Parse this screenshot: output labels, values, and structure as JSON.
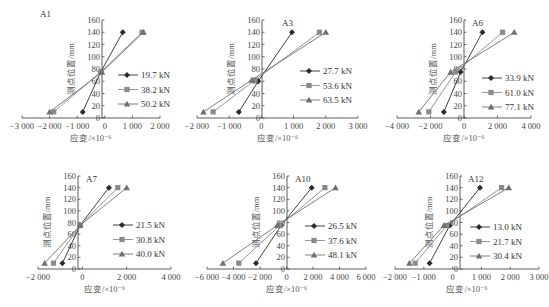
{
  "chart_data": [
    {
      "type": "line",
      "title": "A1",
      "xlabel": "应变/×10⁻⁶",
      "ylabel": "测点位置/mm",
      "xlim": [
        -3000,
        2000
      ],
      "ylim": [
        0,
        160
      ],
      "xticks": [
        -3000,
        -2000,
        -1000,
        0,
        1000,
        2000
      ],
      "xtick_labels": [
        "−3 000",
        "−2 000",
        "−1 000",
        "0",
        "1 000",
        "2 000"
      ],
      "yticks": [
        0,
        20,
        40,
        60,
        80,
        100,
        120,
        140,
        160
      ],
      "legend_position": "right-center",
      "grid": false,
      "series": [
        {
          "name": "19.7 kN",
          "marker": "diamond",
          "points": [
            [
              -800,
              10
            ],
            [
              -150,
              75
            ],
            [
              650,
              140
            ]
          ]
        },
        {
          "name": "38.2 kN",
          "marker": "square",
          "points": [
            [
              -1850,
              10
            ],
            [
              -150,
              75
            ],
            [
              1350,
              140
            ]
          ]
        },
        {
          "name": "50.2 kN",
          "marker": "triangle",
          "points": [
            [
              -2000,
              10
            ],
            [
              -100,
              75
            ],
            [
              1400,
              140
            ]
          ]
        }
      ],
      "frame": {
        "ox": 102,
        "oy": 118,
        "x0px": 22,
        "x1px": 160,
        "ytop": 20,
        "legx": 118,
        "legy": 75
      }
    },
    {
      "type": "line",
      "title": "A3",
      "xlabel": "应变/×10⁻⁶",
      "ylabel": "测点位置/mm",
      "xlim": [
        -2000,
        3000
      ],
      "ylim": [
        0,
        160
      ],
      "xticks": [
        -2000,
        -1000,
        0,
        1000,
        2000,
        3000
      ],
      "xtick_labels": [
        "−2 000",
        "−1 000",
        "0",
        "1 000",
        "2 000",
        "3 000"
      ],
      "yticks": [
        0,
        20,
        40,
        60,
        80,
        100,
        120,
        140,
        160
      ],
      "legend_position": "right-center",
      "grid": false,
      "series": [
        {
          "name": "27.7 kN",
          "marker": "diamond",
          "points": [
            [
              -700,
              10
            ],
            [
              -100,
              60
            ],
            [
              950,
              140
            ]
          ]
        },
        {
          "name": "53.6 kN",
          "marker": "square",
          "points": [
            [
              -1500,
              10
            ],
            [
              -200,
              62
            ],
            [
              1800,
              140
            ]
          ]
        },
        {
          "name": "63.5 kN",
          "marker": "triangle",
          "points": [
            [
              -1800,
              10
            ],
            [
              -300,
              62
            ],
            [
              2000,
              140
            ]
          ]
        }
      ],
      "frame": {
        "ox": 262,
        "oy": 118,
        "x0px": 197,
        "x1px": 358,
        "ytop": 20,
        "legx": 300,
        "legy": 71
      }
    },
    {
      "type": "line",
      "title": "A6",
      "xlabel": "应变/×10⁻⁶",
      "ylabel": "测点位置/mm",
      "xlim": [
        -4000,
        4000
      ],
      "ylim": [
        0,
        160
      ],
      "xticks": [
        -4000,
        -2000,
        0,
        2000,
        4000
      ],
      "xtick_labels": [
        "−4 000",
        "−2 000",
        "0",
        "2 000",
        "4 000"
      ],
      "yticks": [
        0,
        20,
        40,
        60,
        80,
        100,
        120,
        140,
        160
      ],
      "legend_position": "right-center",
      "grid": false,
      "series": [
        {
          "name": "33.9 kN",
          "marker": "diamond",
          "points": [
            [
              -1200,
              10
            ],
            [
              -200,
              75
            ],
            [
              1100,
              140
            ]
          ]
        },
        {
          "name": "61.0 kN",
          "marker": "square",
          "points": [
            [
              -2100,
              10
            ],
            [
              -500,
              75
            ],
            [
              2300,
              140
            ]
          ]
        },
        {
          "name": "77.1 kN",
          "marker": "triangle",
          "points": [
            [
              -2700,
              10
            ],
            [
              -800,
              75
            ],
            [
              3000,
              140
            ]
          ]
        }
      ],
      "frame": {
        "ox": 464,
        "oy": 118,
        "x0px": 397,
        "x1px": 531,
        "ytop": 20,
        "legx": 482,
        "legy": 78
      }
    },
    {
      "type": "line",
      "title": "A7",
      "xlabel": "应变/×10⁻⁶",
      "ylabel": "测点位置/mm",
      "xlim": [
        -2000,
        4000
      ],
      "ylim": [
        0,
        160
      ],
      "xticks": [
        -2000,
        0,
        2000,
        4000
      ],
      "xtick_labels": [
        "−2 000",
        "0",
        "2 000",
        "4 000"
      ],
      "yticks": [
        0,
        20,
        40,
        60,
        80,
        100,
        120,
        140,
        160
      ],
      "legend_position": "right-center",
      "grid": false,
      "series": [
        {
          "name": "21.5 kN",
          "marker": "diamond",
          "points": [
            [
              -900,
              10
            ],
            [
              -100,
              75
            ],
            [
              1200,
              140
            ]
          ]
        },
        {
          "name": "30.8 kN",
          "marker": "square",
          "points": [
            [
              -1300,
              10
            ],
            [
              -100,
              75
            ],
            [
              1600,
              140
            ]
          ]
        },
        {
          "name": "40.0 kN",
          "marker": "triangle",
          "points": [
            [
              -1700,
              10
            ],
            [
              -100,
              75
            ],
            [
              2000,
              140
            ]
          ]
        }
      ],
      "frame": {
        "ox": 78,
        "oy": 269,
        "x0px": 38,
        "x1px": 171,
        "ytop": 176,
        "legx": 113,
        "legy": 225
      }
    },
    {
      "type": "line",
      "title": "A10",
      "xlabel": "应变/×10⁻⁶",
      "ylabel": "测点位置/mm",
      "xlim": [
        -6000,
        6000
      ],
      "ylim": [
        0,
        160
      ],
      "xticks": [
        -6000,
        -4000,
        -2000,
        0,
        2000,
        4000,
        6000
      ],
      "xtick_labels": [
        "−6 000",
        "−4 000",
        "−2 000",
        "0",
        "2 000",
        "4 000",
        "6 000"
      ],
      "yticks": [
        0,
        20,
        40,
        60,
        80,
        100,
        120,
        140,
        160
      ],
      "legend_position": "right-center",
      "grid": false,
      "series": [
        {
          "name": "26.5 kN",
          "marker": "diamond",
          "points": [
            [
              -2300,
              10
            ],
            [
              -400,
              75
            ],
            [
              1900,
              140
            ]
          ]
        },
        {
          "name": "37.6 kN",
          "marker": "square",
          "points": [
            [
              -3600,
              10
            ],
            [
              -500,
              75
            ],
            [
              2900,
              140
            ]
          ]
        },
        {
          "name": "48.1 kN",
          "marker": "triangle",
          "points": [
            [
              -4800,
              10
            ],
            [
              -700,
              75
            ],
            [
              3700,
              140
            ]
          ]
        }
      ],
      "frame": {
        "ox": 287,
        "oy": 269,
        "x0px": 207,
        "x1px": 366,
        "ytop": 176,
        "legx": 305,
        "legy": 226
      }
    },
    {
      "type": "line",
      "title": "A12",
      "xlabel": "应变/×10⁻⁶",
      "ylabel": "测点位置/mm",
      "xlim": [
        -2000,
        3000
      ],
      "ylim": [
        0,
        160
      ],
      "xticks": [
        -2000,
        -1000,
        0,
        1000,
        2000,
        3000
      ],
      "xtick_labels": [
        "−2 000",
        "−1 000",
        "0",
        "1 000",
        "2 000",
        "3 000"
      ],
      "yticks": [
        0,
        20,
        40,
        60,
        80,
        100,
        120,
        140,
        160
      ],
      "legend_position": "right-center",
      "grid": false,
      "series": [
        {
          "name": "13.0 kN",
          "marker": "diamond",
          "points": [
            [
              -800,
              10
            ],
            [
              -100,
              75
            ],
            [
              950,
              140
            ]
          ]
        },
        {
          "name": "21.7 kN",
          "marker": "square",
          "points": [
            [
              -1300,
              10
            ],
            [
              -200,
              75
            ],
            [
              1700,
              140
            ]
          ]
        },
        {
          "name": "30.4 kN",
          "marker": "triangle",
          "points": [
            [
              -1500,
              10
            ],
            [
              -300,
              75
            ],
            [
              1950,
              140
            ]
          ]
        }
      ],
      "frame": {
        "ox": 460,
        "oy": 269,
        "x0px": 395,
        "x1px": 539,
        "ytop": 176,
        "legx": 470,
        "legy": 227
      }
    }
  ],
  "styles": {
    "series_colors": [
      "#2b2b2b",
      "#8a8a8a",
      "#6f6f6f"
    ],
    "axis_color": "#333333"
  }
}
